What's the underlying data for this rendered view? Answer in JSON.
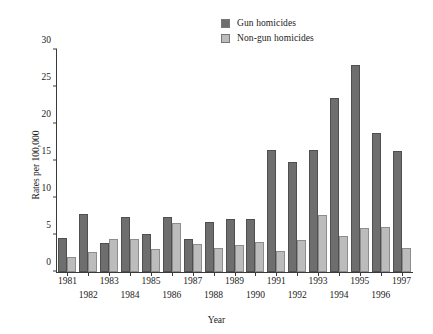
{
  "chart_data": {
    "type": "bar",
    "title": "",
    "xlabel": "Year",
    "ylabel": "Rates per 100,000",
    "ylim": [
      0,
      30
    ],
    "yticks": [
      0,
      5,
      10,
      15,
      20,
      25,
      30
    ],
    "grid": false,
    "legend_position": "top-right",
    "categories": [
      "1981",
      "1982",
      "1983",
      "1984",
      "1985",
      "1986",
      "1987",
      "1988",
      "1989",
      "1990",
      "1991",
      "1992",
      "1993",
      "1994",
      "1995",
      "1996",
      "1997"
    ],
    "series": [
      {
        "name": "Gun homicides",
        "color": "#6e6e6e",
        "values": [
          4.6,
          7.9,
          3.9,
          7.4,
          5.2,
          7.4,
          4.5,
          6.8,
          7.2,
          7.1,
          16.5,
          14.8,
          16.5,
          23.5,
          28.0,
          18.8,
          16.3
        ]
      },
      {
        "name": "Non-gun homicides",
        "color": "#bcbcbc",
        "values": [
          2.0,
          2.7,
          4.4,
          4.4,
          3.1,
          6.6,
          3.8,
          3.3,
          3.7,
          4.0,
          2.8,
          4.3,
          7.7,
          4.9,
          5.9,
          6.1,
          3.2
        ]
      }
    ]
  },
  "legend": {
    "items": [
      {
        "label": "Gun homicides",
        "swatch": "dark-gray-swatch"
      },
      {
        "label": "Non-gun homicides",
        "swatch": "light-gray-swatch"
      }
    ]
  }
}
